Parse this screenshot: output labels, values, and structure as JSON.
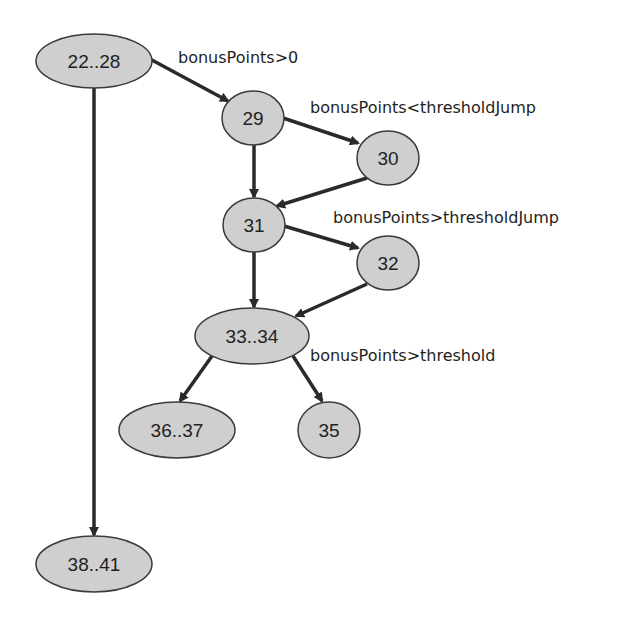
{
  "diagram": {
    "type": "control-flow-graph",
    "nodes": [
      {
        "id": "n22_28",
        "label": "22..28"
      },
      {
        "id": "n29",
        "label": "29"
      },
      {
        "id": "n30",
        "label": "30"
      },
      {
        "id": "n31",
        "label": "31"
      },
      {
        "id": "n32",
        "label": "32"
      },
      {
        "id": "n33_34",
        "label": "33..34"
      },
      {
        "id": "n36_37",
        "label": "36..37"
      },
      {
        "id": "n35",
        "label": "35"
      },
      {
        "id": "n38_41",
        "label": "38..41"
      }
    ],
    "edges": [
      {
        "from": "n22_28",
        "to": "n29",
        "label": "bonusPoints>0"
      },
      {
        "from": "n22_28",
        "to": "n38_41",
        "label": ""
      },
      {
        "from": "n29",
        "to": "n30",
        "label": "bonusPoints<thresholdJump"
      },
      {
        "from": "n29",
        "to": "n31",
        "label": ""
      },
      {
        "from": "n30",
        "to": "n31",
        "label": ""
      },
      {
        "from": "n31",
        "to": "n32",
        "label": "bonusPoints>thresholdJump"
      },
      {
        "from": "n31",
        "to": "n33_34",
        "label": ""
      },
      {
        "from": "n32",
        "to": "n33_34",
        "label": ""
      },
      {
        "from": "n33_34",
        "to": "n36_37",
        "label": ""
      },
      {
        "from": "n33_34",
        "to": "n35",
        "label": "bonusPoints>threshold"
      }
    ]
  }
}
